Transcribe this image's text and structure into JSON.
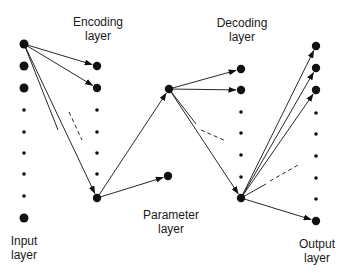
{
  "labels": {
    "encoding": {
      "line1": "Encoding",
      "line2": "layer"
    },
    "decoding": {
      "line1": "Decoding",
      "line2": "layer"
    },
    "parameter": {
      "line1": "Parameter",
      "line2": "layer"
    },
    "input": {
      "line1": "Input",
      "line2": "layer"
    },
    "output": {
      "line1": "Output",
      "line2": "layer"
    }
  },
  "colors": {
    "ink": "#111111",
    "text": "#1a1a1a"
  },
  "nodes": {
    "input": [
      {
        "x": 24,
        "y": 44,
        "r": 4.5
      },
      {
        "x": 24,
        "y": 66,
        "r": 4.5
      },
      {
        "x": 24,
        "y": 88,
        "r": 4.5
      },
      {
        "x": 24,
        "y": 110,
        "r": 1.8
      },
      {
        "x": 24,
        "y": 132,
        "r": 1.8
      },
      {
        "x": 24,
        "y": 153,
        "r": 1.8
      },
      {
        "x": 24,
        "y": 174,
        "r": 1.8
      },
      {
        "x": 24,
        "y": 196,
        "r": 1.8
      },
      {
        "x": 24,
        "y": 218,
        "r": 4.5
      }
    ],
    "encoding": [
      {
        "x": 97,
        "y": 66,
        "r": 4.2
      },
      {
        "x": 97,
        "y": 88,
        "r": 4.2
      },
      {
        "x": 97,
        "y": 110,
        "r": 1.8
      },
      {
        "x": 97,
        "y": 132,
        "r": 1.8
      },
      {
        "x": 97,
        "y": 153,
        "r": 1.8
      },
      {
        "x": 97,
        "y": 174,
        "r": 1.8
      },
      {
        "x": 97,
        "y": 198,
        "r": 4.2
      }
    ],
    "hub": [
      {
        "x": 169,
        "y": 89,
        "r": 4.2
      }
    ],
    "parameter": [
      {
        "x": 168,
        "y": 176,
        "r": 4.2
      }
    ],
    "decoding": [
      {
        "x": 241,
        "y": 69,
        "r": 4.2
      },
      {
        "x": 241,
        "y": 90,
        "r": 4.2
      },
      {
        "x": 241,
        "y": 112,
        "r": 1.8
      },
      {
        "x": 241,
        "y": 133,
        "r": 1.8
      },
      {
        "x": 241,
        "y": 155,
        "r": 1.8
      },
      {
        "x": 241,
        "y": 177,
        "r": 1.8
      },
      {
        "x": 241,
        "y": 198,
        "r": 4.2
      }
    ],
    "output": [
      {
        "x": 316,
        "y": 46,
        "r": 4.2
      },
      {
        "x": 316,
        "y": 68,
        "r": 4.2
      },
      {
        "x": 316,
        "y": 90,
        "r": 4.2
      },
      {
        "x": 316,
        "y": 113,
        "r": 1.8
      },
      {
        "x": 316,
        "y": 134,
        "r": 1.8
      },
      {
        "x": 316,
        "y": 156,
        "r": 1.8
      },
      {
        "x": 316,
        "y": 178,
        "r": 1.8
      },
      {
        "x": 316,
        "y": 199,
        "r": 1.8
      },
      {
        "x": 316,
        "y": 221,
        "r": 4.2
      }
    ]
  },
  "edges": [
    {
      "from": [
        24,
        44
      ],
      "to": [
        97,
        66
      ],
      "arrow": true,
      "dashed": false
    },
    {
      "from": [
        24,
        44
      ],
      "to": [
        97,
        88
      ],
      "arrow": true,
      "dashed": false
    },
    {
      "from": [
        24,
        44
      ],
      "to": [
        97,
        198
      ],
      "arrow": true,
      "dashed": false
    },
    {
      "from": [
        24,
        44
      ],
      "to": [
        58,
        130
      ],
      "arrow": false,
      "dashed": false
    },
    {
      "from": [
        69,
        112
      ],
      "to": [
        82,
        140
      ],
      "arrow": false,
      "dashed": true
    },
    {
      "from": [
        97,
        198
      ],
      "to": [
        169,
        89
      ],
      "arrow": true,
      "dashed": false
    },
    {
      "from": [
        97,
        198
      ],
      "to": [
        168,
        176
      ],
      "arrow": true,
      "dashed": false
    },
    {
      "from": [
        169,
        89
      ],
      "to": [
        241,
        69
      ],
      "arrow": true,
      "dashed": false
    },
    {
      "from": [
        169,
        89
      ],
      "to": [
        241,
        90
      ],
      "arrow": true,
      "dashed": false
    },
    {
      "from": [
        169,
        89
      ],
      "to": [
        241,
        198
      ],
      "arrow": true,
      "dashed": false
    },
    {
      "from": [
        169,
        89
      ],
      "to": [
        196,
        124
      ],
      "arrow": false,
      "dashed": false
    },
    {
      "from": [
        201,
        130
      ],
      "to": [
        226,
        141
      ],
      "arrow": false,
      "dashed": true
    },
    {
      "from": [
        241,
        198
      ],
      "to": [
        316,
        46
      ],
      "arrow": true,
      "dashed": false
    },
    {
      "from": [
        241,
        198
      ],
      "to": [
        316,
        68
      ],
      "arrow": true,
      "dashed": false
    },
    {
      "from": [
        241,
        198
      ],
      "to": [
        316,
        90
      ],
      "arrow": true,
      "dashed": false
    },
    {
      "from": [
        241,
        198
      ],
      "to": [
        266,
        184
      ],
      "arrow": false,
      "dashed": false
    },
    {
      "from": [
        270,
        181
      ],
      "to": [
        300,
        164
      ],
      "arrow": false,
      "dashed": true
    },
    {
      "from": [
        241,
        198
      ],
      "to": [
        316,
        221
      ],
      "arrow": true,
      "dashed": false
    }
  ]
}
